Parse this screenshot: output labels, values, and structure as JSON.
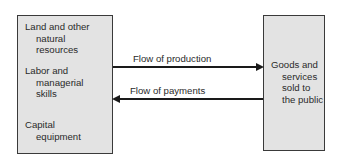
{
  "left_box": {
    "items": [
      {
        "first": "Land and other",
        "rest": [
          "natural",
          "resources"
        ]
      },
      {
        "first": "Labor and",
        "rest": [
          "managerial",
          "skills"
        ]
      },
      {
        "first": "Capital",
        "rest": [
          "equipment"
        ]
      }
    ]
  },
  "right_box": {
    "first": "Goods and",
    "rest": [
      "services",
      "sold to",
      "the public"
    ]
  },
  "arrows": {
    "production": {
      "label": "Flow of production",
      "direction": "right"
    },
    "payments": {
      "label": "Flow of payments",
      "direction": "left"
    }
  },
  "colors": {
    "box_fill": "#e3e3e3",
    "border": "#3a3a3a",
    "arrow": "#1a1a1a"
  }
}
